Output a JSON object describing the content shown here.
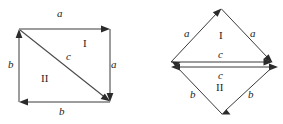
{
  "figure": {
    "background_color": "#ffffff",
    "line_color": "#3a3a3a",
    "arrow_color": "#2b2b2b",
    "text_color": "#1c1c1c"
  },
  "left_figure": {
    "name": "square-with-diagonal",
    "labels": {
      "top_edge": "a",
      "right_edge": "a",
      "left_edge": "b",
      "bottom_edge": "b",
      "diagonal": "c",
      "region_upper": "I",
      "region_lower": "II"
    }
  },
  "right_figure": {
    "name": "rhombus-rearranged",
    "labels": {
      "upper_left_edge": "a",
      "upper_right_edge": "a",
      "lower_left_edge": "b",
      "lower_right_edge": "b",
      "upper_middle_edge": "c",
      "lower_middle_edge": "c",
      "region_upper": "I",
      "region_lower": "II"
    }
  }
}
